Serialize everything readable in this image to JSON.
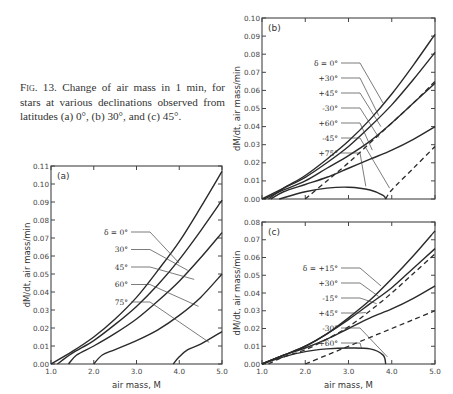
{
  "caption": {
    "prefix": "Fig. 13.",
    "text": " Change of air mass in 1 min, for stars at various declinations observed from latitudes (a) 0°, (b) 30°, and (c) 45°."
  },
  "chart_data": [
    {
      "panel": "(a)",
      "type": "line",
      "title": "Latitude 0°",
      "xlabel": "air mass, M",
      "ylabel": "dM/dt, air mass/min",
      "xlim": [
        1.0,
        5.0
      ],
      "ylim": [
        0.0,
        0.11
      ],
      "xticks": [
        "1.0",
        "2.0",
        "3.0",
        "4.0",
        "5.0"
      ],
      "yticks": [
        "0.00",
        "0.01",
        "0.02",
        "0.03",
        "0.04",
        "0.05",
        "0.06",
        "0.07",
        "0.08",
        "0.09",
        "0.10",
        "0.11"
      ],
      "legend_labels": [
        "δ = 0°",
        "30°",
        "45°",
        "60°",
        "75°"
      ],
      "series": [
        {
          "name": "δ = 0°",
          "x": [
            1.0,
            1.5,
            2.0,
            2.5,
            3.0,
            3.5,
            4.0,
            4.5,
            5.0
          ],
          "y": [
            0.0,
            0.007,
            0.015,
            0.025,
            0.037,
            0.052,
            0.068,
            0.087,
            0.107
          ]
        },
        {
          "name": "30°",
          "x": [
            1.15,
            1.5,
            2.0,
            2.5,
            3.0,
            3.5,
            4.0,
            4.5,
            5.0
          ],
          "y": [
            0.0,
            0.006,
            0.013,
            0.022,
            0.032,
            0.044,
            0.058,
            0.074,
            0.091
          ]
        },
        {
          "name": "45°",
          "x": [
            1.41,
            1.6,
            2.0,
            2.5,
            3.0,
            3.5,
            4.0,
            4.5,
            5.0
          ],
          "y": [
            0.0,
            0.005,
            0.01,
            0.017,
            0.025,
            0.035,
            0.046,
            0.059,
            0.073
          ]
        },
        {
          "name": "60°",
          "x": [
            2.0,
            2.2,
            2.5,
            3.0,
            3.5,
            4.0,
            4.5,
            5.0
          ],
          "y": [
            0.0,
            0.005,
            0.008,
            0.013,
            0.019,
            0.027,
            0.037,
            0.05
          ]
        },
        {
          "name": "75°",
          "x": [
            3.86,
            4.0,
            4.2,
            4.5,
            5.0
          ],
          "y": [
            0.0,
            0.004,
            0.008,
            0.011,
            0.018
          ]
        }
      ]
    },
    {
      "panel": "(b)",
      "type": "line",
      "title": "Latitude 30°",
      "xlabel": "",
      "ylabel": "dM/dt, air mass/min",
      "xlim": [
        1.0,
        5.0
      ],
      "ylim": [
        0.0,
        0.1
      ],
      "xticks": [],
      "yticks": [
        "0.00",
        "0.01",
        "0.02",
        "0.03",
        "0.04",
        "0.05",
        "0.06",
        "0.07",
        "0.08",
        "0.09",
        "0.10"
      ],
      "legend_labels": [
        "δ = 0°",
        "+30°",
        "+45°",
        "-30°",
        "+60°",
        "-45°",
        "+75°"
      ],
      "series": [
        {
          "name": "δ = 0°",
          "style": "solid",
          "x": [
            1.15,
            1.5,
            2.0,
            2.5,
            3.0,
            3.5,
            4.0,
            4.5,
            5.0
          ],
          "y": [
            0.0,
            0.006,
            0.013,
            0.022,
            0.032,
            0.044,
            0.058,
            0.074,
            0.091
          ]
        },
        {
          "name": "+30°",
          "style": "solid",
          "x": [
            1.0,
            1.5,
            2.0,
            2.5,
            3.0,
            3.5,
            4.0,
            4.5,
            5.0
          ],
          "y": [
            0.0,
            0.006,
            0.012,
            0.02,
            0.029,
            0.04,
            0.052,
            0.066,
            0.081
          ]
        },
        {
          "name": "+45°",
          "style": "solid",
          "x": [
            1.05,
            1.5,
            2.0,
            2.5,
            3.0,
            3.5,
            4.0,
            4.5,
            5.0
          ],
          "y": [
            0.0,
            0.005,
            0.01,
            0.017,
            0.024,
            0.032,
            0.042,
            0.053,
            0.064
          ]
        },
        {
          "name": "-30°",
          "style": "dashed",
          "x": [
            2.0,
            2.5,
            3.0,
            3.5,
            4.0,
            4.5,
            5.0
          ],
          "y": [
            0.0,
            0.01,
            0.02,
            0.031,
            0.042,
            0.053,
            0.065
          ]
        },
        {
          "name": "+60°",
          "style": "solid",
          "x": [
            1.2,
            1.5,
            2.0,
            2.5,
            3.0,
            3.5,
            4.0,
            4.5,
            5.0
          ],
          "y": [
            0.0,
            0.004,
            0.008,
            0.012,
            0.017,
            0.022,
            0.027,
            0.033,
            0.04
          ]
        },
        {
          "name": "-45°",
          "style": "dashed",
          "x": [
            3.86,
            4.0,
            4.5,
            5.0
          ],
          "y": [
            0.0,
            0.005,
            0.017,
            0.029
          ]
        },
        {
          "name": "+75°",
          "style": "solid",
          "x": [
            1.4,
            2.0,
            2.5,
            3.0,
            3.5,
            3.8,
            3.86
          ],
          "y": [
            0.0,
            0.004,
            0.006,
            0.0065,
            0.005,
            0.002,
            0.0
          ]
        }
      ]
    },
    {
      "panel": "(c)",
      "type": "line",
      "title": "Latitude 45°",
      "xlabel": "air mass, M",
      "ylabel": "dM/dt, air mass/min",
      "xlim": [
        1.0,
        5.0
      ],
      "ylim": [
        0.0,
        0.08
      ],
      "xticks": [
        "1.0",
        "2.0",
        "3.0",
        "4.0",
        "5.0"
      ],
      "yticks": [
        "0.00",
        "0.01",
        "0.02",
        "0.03",
        "0.04",
        "0.05",
        "0.06",
        "0.07",
        "0.08"
      ],
      "legend_labels": [
        "δ = +15°",
        "+30°",
        "-15°",
        "+45°",
        "-30°",
        "+60°"
      ],
      "series": [
        {
          "name": "δ = +15°",
          "style": "solid",
          "x": [
            1.0,
            1.5,
            2.0,
            2.5,
            3.0,
            3.5,
            4.0,
            4.5,
            5.0
          ],
          "y": [
            0.0,
            0.005,
            0.01,
            0.017,
            0.026,
            0.036,
            0.048,
            0.061,
            0.075
          ]
        },
        {
          "name": "+30°",
          "style": "solid",
          "x": [
            1.0,
            1.5,
            2.0,
            2.5,
            3.0,
            3.5,
            4.0,
            4.5,
            5.0
          ],
          "y": [
            0.0,
            0.005,
            0.01,
            0.017,
            0.025,
            0.034,
            0.043,
            0.054,
            0.065
          ]
        },
        {
          "name": "-15°",
          "style": "dashed",
          "x": [
            1.15,
            1.5,
            2.0,
            2.5,
            3.0,
            3.5,
            4.0,
            4.5,
            5.0
          ],
          "y": [
            0.0,
            0.004,
            0.008,
            0.014,
            0.021,
            0.03,
            0.04,
            0.051,
            0.062
          ]
        },
        {
          "name": "+45°",
          "style": "solid",
          "x": [
            1.0,
            1.5,
            2.0,
            2.5,
            3.0,
            3.5,
            4.0,
            4.5,
            5.0
          ],
          "y": [
            0.0,
            0.005,
            0.009,
            0.014,
            0.02,
            0.026,
            0.031,
            0.037,
            0.044
          ]
        },
        {
          "name": "-30°",
          "style": "dashed",
          "x": [
            2.0,
            2.5,
            3.0,
            3.5,
            4.0,
            4.5,
            5.0
          ],
          "y": [
            0.0,
            0.005,
            0.01,
            0.015,
            0.02,
            0.025,
            0.03
          ]
        },
        {
          "name": "+60°",
          "style": "solid",
          "x": [
            1.0,
            1.5,
            2.0,
            2.5,
            3.0,
            3.5,
            3.8,
            3.86
          ],
          "y": [
            0.0,
            0.004,
            0.007,
            0.0085,
            0.009,
            0.0085,
            0.005,
            0.0
          ]
        }
      ]
    }
  ]
}
